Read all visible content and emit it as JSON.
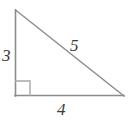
{
  "figure": {
    "name": "right-triangle-3-4-5",
    "background_color": "#ffffff",
    "stroke_color": "#8c8c8c",
    "label_color": "#3b3b3b",
    "labels": {
      "leg_vertical": "3",
      "leg_horizontal": "4",
      "hypotenuse": "5"
    },
    "geometry": {
      "vertex_top": [
        15,
        10
      ],
      "vertex_bottom_left": [
        15,
        96
      ],
      "vertex_bottom_right": [
        124,
        96
      ],
      "right_angle_marker": {
        "corner": [
          15,
          96
        ],
        "size": 15
      }
    }
  }
}
